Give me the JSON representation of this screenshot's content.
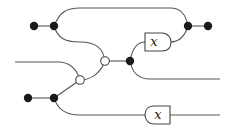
{
  "diagram": {
    "type": "string-diagram",
    "gates": [
      {
        "id": "gate-top",
        "label": "x"
      },
      {
        "id": "gate-bottom",
        "label": "x"
      }
    ],
    "nodes": {
      "black_dots": 7,
      "white_dots": 2
    },
    "colors": {
      "wire": "#555555",
      "black_node": "#1a1a1a",
      "white_node": "#ffffff"
    }
  }
}
